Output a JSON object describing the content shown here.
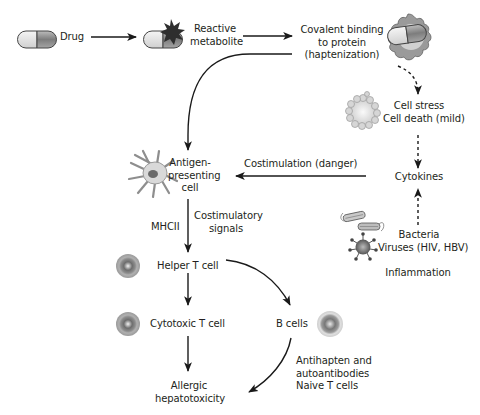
{
  "diagram": {
    "nodes": {
      "drug": {
        "label": "Drug",
        "icon": "capsule-icon"
      },
      "reactive_metabolite": {
        "lines": [
          "Reactive",
          "metabolite"
        ],
        "icon": "capsule-with-starburst-icon"
      },
      "covalent_binding": {
        "lines": [
          "Covalent binding",
          "to protein",
          "(haptenization)"
        ],
        "icon": "capsule-protein-complex-icon"
      },
      "cell_stress": {
        "lines": [
          "Cell stress",
          "Cell death (mild)"
        ],
        "icon": "stressed-cell-icon"
      },
      "cytokines": {
        "label": "Cytokines"
      },
      "pathogens": {
        "lines": [
          "Bacteria",
          "Viruses (HIV, HBV)"
        ],
        "icon": "bacteria-virus-icon"
      },
      "inflammation": {
        "label": "Inflammation"
      },
      "apc": {
        "lines": [
          "Antigen-",
          "presenting",
          "cell"
        ],
        "icon": "dendritic-cell-icon"
      },
      "helper_t": {
        "label": "Helper T cell",
        "icon": "t-cell-icon"
      },
      "cytotoxic_t": {
        "label": "Cytotoxic T cell",
        "icon": "t-cell-icon"
      },
      "b_cells": {
        "label": "B cells",
        "icon": "b-cell-icon"
      },
      "allergic_hepatotoxicity": {
        "lines": [
          "Allergic",
          "hepatotoxicity"
        ]
      }
    },
    "edge_labels": {
      "costimulation": "Costimulation (danger)",
      "mhcii": "MHCII",
      "costimulatory_signals": [
        "Costimulatory",
        "signals"
      ],
      "antibodies": [
        "Antihapten and",
        "autoantibodies",
        "Naive T cells"
      ]
    },
    "edges": [
      {
        "from": "drug",
        "to": "reactive_metabolite",
        "style": "solid"
      },
      {
        "from": "reactive_metabolite",
        "to": "covalent_binding",
        "style": "solid"
      },
      {
        "from": "covalent_binding",
        "to": "apc",
        "style": "solid-curved"
      },
      {
        "from": "covalent_binding",
        "to": "cell_stress",
        "style": "dashed-curved"
      },
      {
        "from": "cell_stress",
        "to": "cytokines",
        "style": "dashed"
      },
      {
        "from": "pathogens",
        "to": "cytokines",
        "style": "dashed"
      },
      {
        "from": "cytokines",
        "to": "apc",
        "style": "solid",
        "label": "Costimulation (danger)"
      },
      {
        "from": "apc",
        "to": "helper_t",
        "style": "solid",
        "label": "MHCII / Costimulatory signals"
      },
      {
        "from": "helper_t",
        "to": "cytotoxic_t",
        "style": "solid"
      },
      {
        "from": "helper_t",
        "to": "b_cells",
        "style": "solid-curved"
      },
      {
        "from": "cytotoxic_t",
        "to": "allergic_hepatotoxicity",
        "style": "solid"
      },
      {
        "from": "b_cells",
        "to": "allergic_hepatotoxicity",
        "style": "solid-curved",
        "label": "Antihapten and autoantibodies / Naive T cells"
      }
    ],
    "colors": {
      "line": "#1a1a1a",
      "capsule_light": "#e8e8e8",
      "capsule_dark": "#8a8a8a",
      "cell_gray": "#9a9a9a",
      "starburst": "#333333"
    }
  }
}
